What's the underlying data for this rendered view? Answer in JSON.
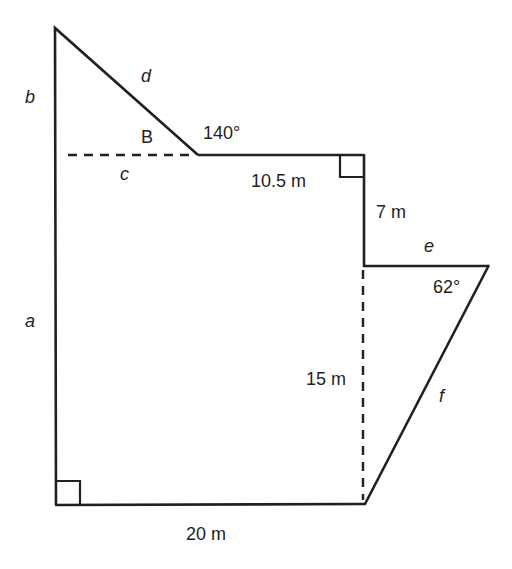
{
  "diagram": {
    "type": "composite polygon with labeled sides and angles",
    "labels": {
      "a": "a",
      "b": "b",
      "c": "c",
      "d": "d",
      "e": "e",
      "f": "f",
      "B": "B",
      "angle_top": "140°",
      "angle_right": "62°",
      "top_length": "10.5 m",
      "right_upper_length": "7 m",
      "dashed_height": "15 m",
      "bottom_length": "20 m"
    },
    "colors": {
      "line": "#231f20",
      "background": "#ffffff"
    }
  }
}
